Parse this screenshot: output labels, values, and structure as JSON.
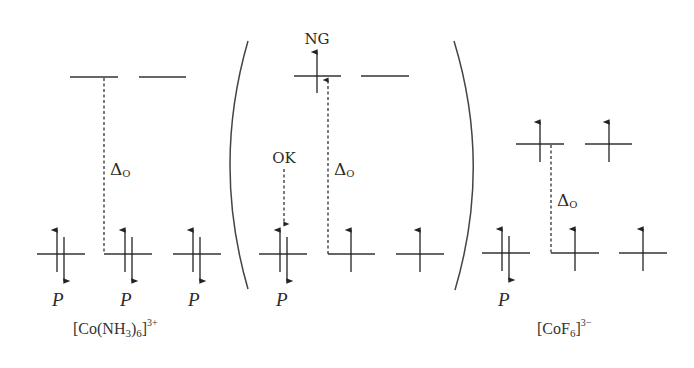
{
  "diagram": {
    "type": "crystal-field-splitting",
    "colors": {
      "line": "#333333",
      "text": "#2a2a2a",
      "background": "#ffffff"
    },
    "groups": [
      {
        "id": "co-nh3-6",
        "complex_label": {
          "prefix": "[Co(NH",
          "sub1": "3",
          "mid": ")",
          "sub2": "6",
          "suffix": "]",
          "charge": "3+"
        },
        "splitting_label": {
          "main": "Δ",
          "sub": "O"
        },
        "upper_orbitals": [
          {
            "electrons": "empty"
          },
          {
            "electrons": "empty"
          }
        ],
        "lower_orbitals": [
          {
            "electrons": "paired",
            "label": "P"
          },
          {
            "electrons": "paired",
            "label": "P"
          },
          {
            "electrons": "paired",
            "label": "P"
          }
        ]
      },
      {
        "id": "hypothetical",
        "splitting_label": {
          "main": "Δ",
          "sub": "O"
        },
        "annotations": {
          "ok": "OK",
          "ng": "NG"
        },
        "upper_orbitals": [
          {
            "electrons": "up"
          },
          {
            "electrons": "empty"
          }
        ],
        "lower_orbitals": [
          {
            "electrons": "paired",
            "label": "P"
          },
          {
            "electrons": "up"
          },
          {
            "electrons": "up"
          }
        ]
      },
      {
        "id": "cof6",
        "complex_label": {
          "prefix": "[CoF",
          "sub1": "6",
          "suffix": "]",
          "charge": "3−"
        },
        "splitting_label": {
          "main": "Δ",
          "sub": "O"
        },
        "upper_orbitals": [
          {
            "electrons": "up"
          },
          {
            "electrons": "up"
          }
        ],
        "lower_orbitals": [
          {
            "electrons": "paired",
            "label": "P"
          },
          {
            "electrons": "up"
          },
          {
            "electrons": "up"
          }
        ]
      }
    ]
  }
}
